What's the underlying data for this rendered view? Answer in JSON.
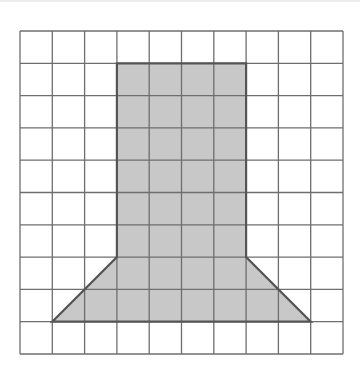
{
  "diagram": {
    "type": "grid-figure",
    "grid": {
      "columns": 10,
      "rows": 10,
      "origin_px": [
        20,
        31
      ],
      "cell_size_px": 32.3,
      "line_color": "#6e6e6e",
      "background": "#ffffff"
    },
    "shape": {
      "name": "shaded-polygon",
      "fill": "#c8c8c8",
      "stroke": "#555555",
      "vertices_grid": [
        [
          3,
          1
        ],
        [
          7,
          1
        ],
        [
          7,
          7
        ],
        [
          9,
          9
        ],
        [
          1,
          9
        ],
        [
          3,
          7
        ]
      ],
      "description": "Rectangle 4 wide by 6 tall on top of a trapezoid 4 wide at top, 8 wide at base, 2 tall"
    }
  }
}
